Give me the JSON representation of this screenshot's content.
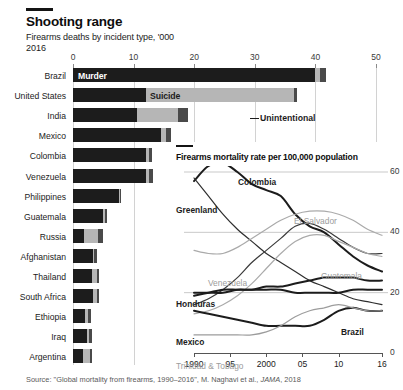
{
  "header": {
    "title": "Shooting range",
    "subtitle": "Firearms deaths by incident type, '000",
    "year": "2016"
  },
  "source": {
    "prefix": "Source: \"Global mortality from firearms, 1990–2016\", M. Naghavi et al., ",
    "journal": "JAMA",
    "suffix": ", 2018"
  },
  "chart_data": [
    {
      "type": "bar",
      "orientation": "horizontal",
      "stacked": true,
      "title": "Shooting range",
      "subtitle": "Firearms deaths by incident type, '000",
      "year": "2016",
      "xlabel": "",
      "ylabel": "",
      "xlim": [
        0,
        50
      ],
      "xticks": [
        0,
        10,
        20,
        30,
        40,
        50
      ],
      "xtick_labels": [
        "0",
        "10",
        "20",
        "30",
        "40",
        "50"
      ],
      "grid": true,
      "legend_position": "in-bars",
      "series_names": [
        "Murder",
        "Suicide",
        "Unintentional"
      ],
      "series_colors": [
        "#1c1c1c",
        "#b6b6b6",
        "#4a4a4a"
      ],
      "categories": [
        "Brazil",
        "United States",
        "India",
        "Mexico",
        "Colombia",
        "Venezuela",
        "Philippines",
        "Guatemala",
        "Russia",
        "Afghanistan",
        "Thailand",
        "South Africa",
        "Ethiopia",
        "Iraq",
        "Argentina"
      ],
      "series": [
        {
          "name": "Murder",
          "values": [
            40.0,
            12.1,
            10.6,
            14.5,
            12.1,
            12.0,
            7.6,
            5.0,
            1.8,
            3.3,
            3.1,
            3.3,
            1.9,
            2.3,
            1.6
          ]
        },
        {
          "name": "Suicide",
          "values": [
            0.8,
            24.4,
            6.8,
            0.9,
            0.5,
            0.6,
            0.2,
            0.3,
            2.4,
            0.2,
            0.9,
            0.6,
            0.5,
            0.4,
            1.2
          ]
        },
        {
          "name": "Unintentional",
          "values": [
            0.9,
            0.5,
            1.5,
            0.8,
            0.4,
            0.6,
            0.2,
            0.3,
            0.8,
            0.4,
            0.3,
            0.4,
            0.5,
            0.5,
            0.4
          ]
        }
      ],
      "annotations": [
        {
          "text": "Murder",
          "series": "Murder"
        },
        {
          "text": "Suicide",
          "series": "Suicide"
        },
        {
          "text": "Unintentional",
          "series": "Unintentional"
        }
      ]
    },
    {
      "type": "line",
      "title": "Firearms mortality rate per 100,000 population",
      "xlabel": "",
      "ylabel": "",
      "xlim": [
        1990,
        2016
      ],
      "ylim": [
        0,
        60
      ],
      "yticks": [
        0,
        20,
        40,
        60
      ],
      "ytick_labels": [
        "0",
        "20",
        "40",
        "60"
      ],
      "xticks": [
        1990,
        1995,
        2000,
        2005,
        2010,
        2016
      ],
      "xtick_labels": [
        "1990",
        "95",
        "2000",
        "05",
        "10",
        "16"
      ],
      "grid": true,
      "legend_position": "inline-labels",
      "x": [
        1990,
        1992,
        1994,
        1996,
        1998,
        2000,
        2002,
        2004,
        2006,
        2008,
        2010,
        2012,
        2014,
        2016
      ],
      "series": [
        {
          "name": "Colombia",
          "color": "#1c1c1c",
          "emphasis": "bold",
          "values": [
            57,
            62,
            63,
            60,
            56,
            54,
            52,
            46,
            42,
            40,
            36,
            32,
            29,
            27
          ]
        },
        {
          "name": "Greenland",
          "color": "#2e2e2e",
          "emphasis": "normal",
          "values": [
            58,
            52,
            46,
            41,
            37,
            33,
            30,
            27,
            24,
            22,
            20,
            18,
            17,
            16
          ]
        },
        {
          "name": "El Salvador",
          "color": "#aaaaaa",
          "emphasis": "normal",
          "values": [
            34,
            33,
            33,
            35,
            38,
            41,
            44,
            46,
            47,
            47,
            46,
            44,
            41,
            39
          ]
        },
        {
          "name": "Venezuela",
          "color": "#3a3a3a",
          "emphasis": "normal",
          "values": [
            16,
            18,
            21,
            25,
            30,
            34,
            38,
            42,
            43,
            41,
            38,
            35,
            33,
            33
          ]
        },
        {
          "name": "Guatemala",
          "color": "#aaaaaa",
          "emphasis": "normal",
          "values": [
            13,
            14,
            16,
            19,
            23,
            28,
            33,
            37,
            39,
            39,
            37,
            35,
            33,
            32
          ]
        },
        {
          "name": "Honduras",
          "color": "#1c1c1c",
          "emphasis": "bold",
          "values": [
            20,
            20,
            20,
            21,
            21,
            22,
            22,
            23,
            24,
            25,
            25,
            25,
            24,
            24
          ]
        },
        {
          "name": "Brazil",
          "color": "#1c1c1c",
          "emphasis": "bold",
          "values": [
            19,
            20,
            21,
            21,
            21,
            21,
            21,
            20,
            20,
            20,
            20,
            21,
            21,
            21
          ]
        },
        {
          "name": "Mexico",
          "color": "#1c1c1c",
          "emphasis": "bold",
          "values": [
            14,
            13,
            12,
            11,
            10,
            9,
            9,
            9,
            9,
            11,
            14,
            15,
            14,
            14
          ]
        },
        {
          "name": "Trinidad & Tobago",
          "color": "#9c9c9c",
          "emphasis": "normal",
          "values": [
            6,
            6,
            6,
            6,
            6,
            7,
            9,
            12,
            14,
            15,
            16,
            15,
            14,
            14
          ]
        }
      ],
      "annotations": [
        {
          "text": "Colombia",
          "style": "bold"
        },
        {
          "text": "Greenland",
          "style": "bold"
        },
        {
          "text": "El Salvador",
          "style": "grey"
        },
        {
          "text": "Venezuela",
          "style": "grey"
        },
        {
          "text": "Guatemala",
          "style": "grey"
        },
        {
          "text": "Honduras",
          "style": "bold"
        },
        {
          "text": "Brazil",
          "style": "bold"
        },
        {
          "text": "Mexico",
          "style": "bold"
        },
        {
          "text": "Trinidad & Tobago",
          "style": "grey"
        }
      ]
    }
  ]
}
